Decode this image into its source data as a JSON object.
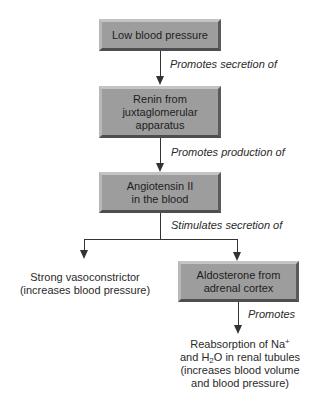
{
  "diagram": {
    "type": "flowchart",
    "boxes": {
      "low_bp": "Low blood pressure",
      "renin": "Renin from\njuxtaglomerular\napparatus",
      "angiotensin": "Angiotensin II\nin the blood",
      "aldosterone": "Aldosterone from\nadrenal cortex"
    },
    "edges": {
      "e1": "Promotes secretion of",
      "e2": "Promotes production of",
      "e3": "Stimulates secretion of",
      "e4": "Promotes"
    },
    "outcomes": {
      "vasoconstrictor_line1": "Strong vasoconstrictor",
      "vasoconstrictor_line2": "(increases blood pressure)",
      "reabsorption_line1_pre": "Reabsorption of Na",
      "reabsorption_line1_sup": "+",
      "reabsorption_line2_pre": "and H",
      "reabsorption_line2_sub": "2",
      "reabsorption_line2_post": "O in renal tubules",
      "reabsorption_line3": "(increases blood volume",
      "reabsorption_line4": "and blood pressure)"
    },
    "colors": {
      "box_fill": "#9d9d9d",
      "line": "#333333",
      "text": "#222222"
    }
  }
}
